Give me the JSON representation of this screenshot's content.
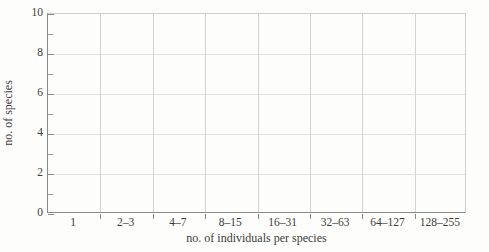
{
  "chart_data": {
    "type": "bar",
    "title": "",
    "xlabel": "no. of individuals per species",
    "ylabel": "no. of species",
    "categories": [
      "1",
      "2–3",
      "4–7",
      "8–15",
      "16–31",
      "32–63",
      "64–127",
      "128–255"
    ],
    "values": [
      0,
      0,
      0,
      0,
      0,
      0,
      0,
      0
    ],
    "ylim": [
      0,
      10
    ],
    "ytick_labels": [
      "0",
      "2",
      "4",
      "6",
      "8",
      "10"
    ],
    "ytick_values": [
      0,
      2,
      4,
      6,
      8,
      10
    ],
    "yminor_values": [
      1,
      3,
      5,
      7,
      9
    ],
    "grid": true,
    "legend": "none",
    "colors": {
      "background": "#fdfdfb",
      "axis": "#8a8a8a",
      "gridline": "#d3d3d3",
      "text": "#3c3c3c"
    }
  }
}
